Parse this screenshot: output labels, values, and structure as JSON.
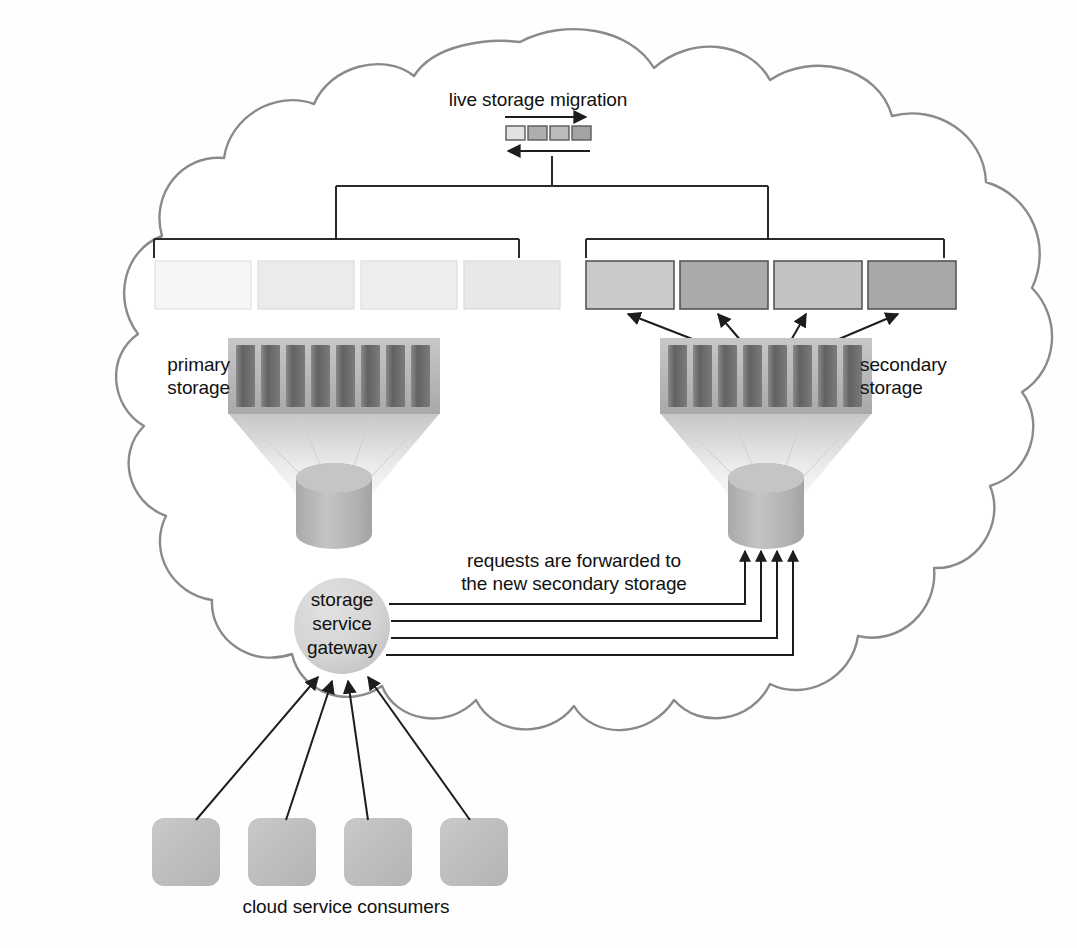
{
  "diagram": {
    "title": "live storage migration",
    "domain": "cloud storage architecture",
    "labels": {
      "migration": "live storage migration",
      "primary_storage": "primary\nstorage",
      "secondary_storage": "secondary\nstorage",
      "requests_note": "requests are forwarded to\nthe new secondary storage",
      "gateway": "storage\nservice\ngateway",
      "consumers": "cloud service consumers"
    },
    "gateway": {
      "line1": "storage",
      "line2": "service",
      "line3": "gateway"
    },
    "colors": {
      "cloud_stroke": "#8a8a8a",
      "background": "#fefefe",
      "text": "#111111",
      "connector_line": "#2b2b2b",
      "array_shell": "#b9b9b9",
      "array_bar": "#6f6f6f",
      "cylinder": "#b6b6b6",
      "gateway_fill": "#d4d4d4",
      "consumer_fill": "#bfbfbf",
      "lun_primary_light": "#f4f4f4",
      "lun_primary": "#e9e9e9",
      "lun_secondary_light": "#c9c9c9",
      "lun_secondary_dark": "#aaaaaa",
      "migration_box_1": "#e0e0e0",
      "migration_box_2": "#b0b0b0",
      "migration_box_3": "#bdbdbd",
      "migration_box_4": "#a6a6a6"
    },
    "counts": {
      "primary_luns": 4,
      "secondary_luns": 4,
      "array_bars": 8,
      "consumers": 4,
      "gateway_request_lines": 4,
      "migration_boxes": 4
    },
    "primary_luns": [
      {
        "index": 1,
        "fill": "#f6f6f6"
      },
      {
        "index": 2,
        "fill": "#ebebeb"
      },
      {
        "index": 3,
        "fill": "#eeeeee"
      },
      {
        "index": 4,
        "fill": "#e8e8e8"
      }
    ],
    "secondary_luns": [
      {
        "index": 1,
        "fill": "#cacaca"
      },
      {
        "index": 2,
        "fill": "#aaaaaa"
      },
      {
        "index": 3,
        "fill": "#c2c2c2"
      },
      {
        "index": 4,
        "fill": "#a8a8a8"
      }
    ],
    "migration_boxes": [
      {
        "index": 1,
        "fill": "#e2e2e2"
      },
      {
        "index": 2,
        "fill": "#aeaeae"
      },
      {
        "index": 3,
        "fill": "#bcbcbc"
      },
      {
        "index": 4,
        "fill": "#a4a4a4"
      }
    ],
    "arrows": {
      "migration_right": "left-to-right",
      "migration_left": "right-to-left",
      "secondary_array_to_luns": 4,
      "gateway_to_secondary_cylinder": 4,
      "consumers_to_gateway": 4
    }
  }
}
